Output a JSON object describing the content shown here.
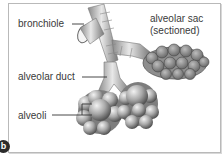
{
  "diagram": {
    "panel_label": "b",
    "labels": {
      "bronchiole": "bronchiole",
      "alveolar_sac_line1": "alveolar sac",
      "alveolar_sac_line2": "(sectioned)",
      "alveolar_duct": "alveolar duct",
      "alveoli": "alveoli"
    },
    "colors": {
      "frame": "#b9b9b9",
      "text": "#3a3a3a",
      "tissue_light": "#d4d4d4",
      "tissue_mid": "#9a9a9a",
      "tissue_dark": "#5c5c5c",
      "badge": "#2b2b2b"
    }
  }
}
